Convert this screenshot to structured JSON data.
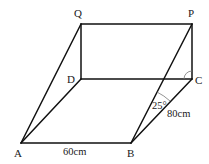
{
  "figure": {
    "vertices": {
      "A": {
        "label": "A",
        "x": 21,
        "y": 143
      },
      "B": {
        "label": "B",
        "x": 131,
        "y": 143
      },
      "C": {
        "label": "C",
        "x": 192,
        "y": 79
      },
      "D": {
        "label": "D",
        "x": 81,
        "y": 79
      },
      "P": {
        "label": "P",
        "x": 192,
        "y": 24
      },
      "Q": {
        "label": "Q",
        "x": 81,
        "y": 24
      }
    },
    "edges": [
      [
        "A",
        "B"
      ],
      [
        "B",
        "C"
      ],
      [
        "C",
        "D"
      ],
      [
        "D",
        "A"
      ],
      [
        "Q",
        "P"
      ],
      [
        "Q",
        "D"
      ],
      [
        "P",
        "C"
      ],
      [
        "A",
        "Q"
      ],
      [
        "B",
        "P"
      ]
    ],
    "measurements": {
      "AB": "60 cm",
      "BC": "80 cm",
      "angle_PBC": "25°"
    },
    "angle_markers": [
      {
        "at": "B",
        "between": [
          "P",
          "C"
        ],
        "label": "25°"
      },
      {
        "at": "C",
        "between": [
          "P",
          "D"
        ],
        "label": ""
      }
    ]
  },
  "labels": {
    "A": "A",
    "B": "B",
    "C": "C",
    "D": "D",
    "P": "P",
    "Q": "Q",
    "ab_length": "60cm",
    "bc_length": "80cm",
    "angle_b": "25°"
  }
}
